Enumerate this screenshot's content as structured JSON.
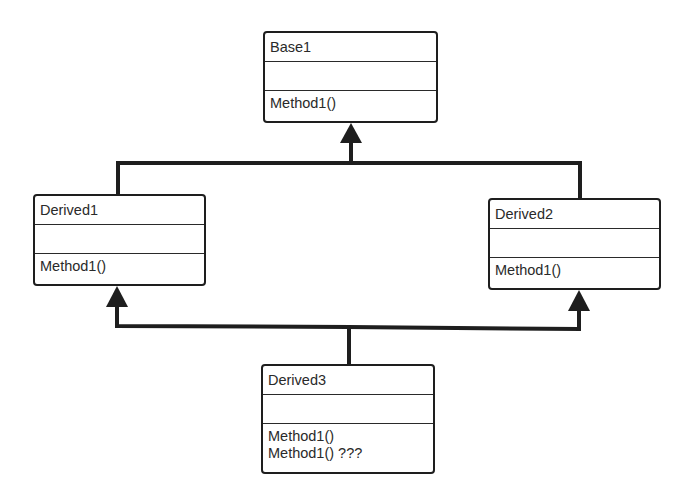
{
  "diagram": {
    "type": "uml-class-diagram",
    "line_color": "#1e1e1e",
    "classes": [
      {
        "id": "base1",
        "name": "Base1",
        "attributes": [],
        "methods": [
          "Method1()"
        ]
      },
      {
        "id": "derived1",
        "name": "Derived1",
        "attributes": [],
        "methods": [
          "Method1()"
        ]
      },
      {
        "id": "derived2",
        "name": "Derived2",
        "attributes": [],
        "methods": [
          "Method1()"
        ]
      },
      {
        "id": "derived3",
        "name": "Derived3",
        "attributes": [],
        "methods": [
          "Method1()",
          "Method1() ???"
        ]
      }
    ],
    "relationships": [
      {
        "type": "inheritance",
        "from": "Derived1",
        "to": "Base1"
      },
      {
        "type": "inheritance",
        "from": "Derived2",
        "to": "Base1"
      },
      {
        "type": "inheritance",
        "from": "Derived3",
        "to": "Derived1"
      },
      {
        "type": "inheritance",
        "from": "Derived3",
        "to": "Derived2"
      }
    ]
  }
}
